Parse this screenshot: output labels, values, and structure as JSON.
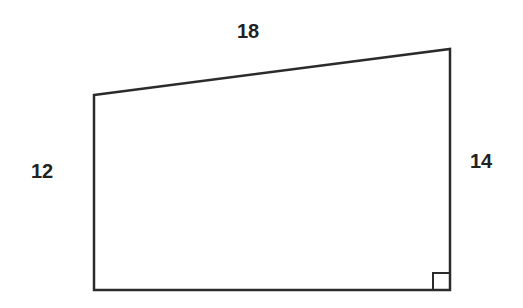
{
  "diagram": {
    "type": "right trapezoid",
    "stroke_color": "#2b2b2b",
    "vertices": {
      "top_left": [
        94,
        95
      ],
      "top_right": [
        450,
        49
      ],
      "bottom_right": [
        450,
        290
      ],
      "bottom_left": [
        94,
        290
      ]
    },
    "right_angle_marker": {
      "corner": "bottom_right",
      "size": 17
    },
    "labels": {
      "top": "18",
      "left": "12",
      "right": "14"
    }
  }
}
